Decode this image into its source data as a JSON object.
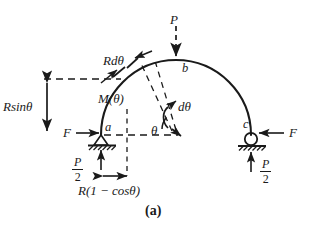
{
  "figure": {
    "caption": "(a)",
    "type": "free-body diagram of a semicircular arch",
    "background_color": "#ffffff",
    "ink_color": "#1a1a1a"
  },
  "loads": {
    "applied_load_label": "P",
    "left_horizontal_force_label": "F",
    "right_horizontal_force_label": "F",
    "left_reaction": {
      "numerator": "P",
      "denominator": "2"
    },
    "right_reaction": {
      "numerator": "P",
      "denominator": "2"
    }
  },
  "points": {
    "left_support": "a",
    "apex": "b",
    "right_support": "c"
  },
  "annotations": {
    "arc_element": "Rdθ",
    "internal_moment": "M(θ)",
    "angle": "θ",
    "angle_increment": "dθ",
    "vertical_dimension": "Rsinθ",
    "horizontal_dimension": "R(1 − cosθ)"
  },
  "supports": {
    "left": {
      "kind": "pin-support",
      "label": "a"
    },
    "right": {
      "kind": "roller-support",
      "label": "c"
    }
  }
}
